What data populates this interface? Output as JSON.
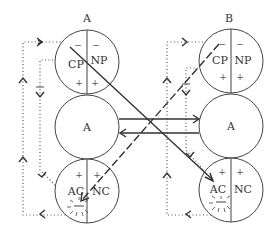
{
  "diagram": {
    "columns": [
      {
        "title": "A",
        "top_circle": {
          "left": "CP",
          "right": "NP",
          "left_top": "−",
          "right_top": "−",
          "left_bottom": "+",
          "right_bottom": "+"
        },
        "middle_circle": {
          "label": "A"
        },
        "bottom_circle": {
          "left": "AC",
          "right": "NC",
          "left_top": "+",
          "right_top": "+"
        }
      },
      {
        "title": "B",
        "top_circle": {
          "left": "CP",
          "right": "NP",
          "left_top": "−",
          "right_top": "−",
          "left_bottom": "+",
          "right_bottom": "+"
        },
        "middle_circle": {
          "label": "A"
        },
        "bottom_circle": {
          "left": "AC",
          "right": "NC",
          "left_top": "+",
          "right_top": "+"
        }
      }
    ],
    "connections": [
      {
        "from": "A.middle",
        "to": "B.middle",
        "style": "solid"
      },
      {
        "from": "B.middle",
        "to": "A.middle",
        "style": "solid"
      },
      {
        "from": "A.CP",
        "to": "B.AC",
        "style": "solid"
      },
      {
        "from": "B.CP",
        "to": "A.AC",
        "style": "dashed"
      }
    ],
    "feedback_loop_marker": "−"
  }
}
